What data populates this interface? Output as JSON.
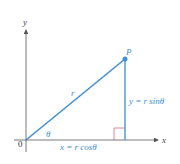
{
  "diagram": {
    "labels": {
      "x_axis": "x",
      "y_axis": "y",
      "origin": "0",
      "point": "P",
      "radius": "r",
      "angle": "θ",
      "x_eq": "x = r cosθ",
      "y_eq": "y = r sinθ"
    },
    "colors": {
      "axis": "#555555",
      "vector": "#3d8fd6",
      "right_angle": "#d26a7a",
      "label_blue": "#3d8fd6"
    }
  }
}
